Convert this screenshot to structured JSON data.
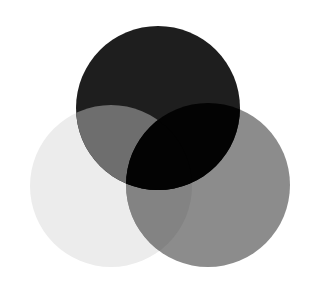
{
  "diagram": {
    "type": "venn",
    "sets": [
      {
        "id": "top",
        "label": "",
        "color": "#1e1e1e"
      },
      {
        "id": "left",
        "label": "",
        "color": "#ececec"
      },
      {
        "id": "right",
        "label": "",
        "color": "#8c8c8c"
      }
    ],
    "regions": {
      "top_only": "#1e1e1e",
      "left_only": "#ececec",
      "right_only": "#8c8c8c",
      "top_left": "#6e6e6e",
      "left_right": "#838383",
      "top_right": "#030303",
      "all_three": "#030303"
    },
    "background": "#ffffff"
  }
}
